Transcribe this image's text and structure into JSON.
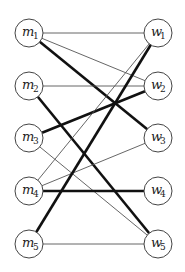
{
  "diagram": {
    "type": "bipartite-graph",
    "left_nodes": [
      {
        "id": "m1",
        "base": "m",
        "sub": "1",
        "x": 29,
        "y": 33
      },
      {
        "id": "m2",
        "base": "m",
        "sub": "2",
        "x": 29,
        "y": 86
      },
      {
        "id": "m3",
        "base": "m",
        "sub": "3",
        "x": 29,
        "y": 138
      },
      {
        "id": "m4",
        "base": "m",
        "sub": "4",
        "x": 29,
        "y": 191
      },
      {
        "id": "m5",
        "base": "m",
        "sub": "5",
        "x": 29,
        "y": 244
      }
    ],
    "right_nodes": [
      {
        "id": "w1",
        "base": "w",
        "sub": "1",
        "x": 158,
        "y": 33
      },
      {
        "id": "w2",
        "base": "w",
        "sub": "2",
        "x": 158,
        "y": 86
      },
      {
        "id": "w3",
        "base": "w",
        "sub": "3",
        "x": 158,
        "y": 138
      },
      {
        "id": "w4",
        "base": "w",
        "sub": "4",
        "x": 158,
        "y": 191
      },
      {
        "id": "w5",
        "base": "w",
        "sub": "5",
        "x": 158,
        "y": 244
      }
    ],
    "node_radius": 14,
    "edges": [
      {
        "from": "m1",
        "to": "w1",
        "weight": "thin"
      },
      {
        "from": "m1",
        "to": "w2",
        "weight": "thin"
      },
      {
        "from": "m1",
        "to": "w3",
        "weight": "thick"
      },
      {
        "from": "m2",
        "to": "w2",
        "weight": "thin"
      },
      {
        "from": "m2",
        "to": "w5",
        "weight": "thick"
      },
      {
        "from": "m3",
        "to": "w2",
        "weight": "thick"
      },
      {
        "from": "m3",
        "to": "w5",
        "weight": "thin"
      },
      {
        "from": "m4",
        "to": "w1",
        "weight": "thin"
      },
      {
        "from": "m4",
        "to": "w3",
        "weight": "thin"
      },
      {
        "from": "m4",
        "to": "w4",
        "weight": "thick"
      },
      {
        "from": "m5",
        "to": "w1",
        "weight": "thick"
      },
      {
        "from": "m5",
        "to": "w5",
        "weight": "thin"
      }
    ],
    "matching": [
      [
        "m1",
        "w3"
      ],
      [
        "m2",
        "w5"
      ],
      [
        "m3",
        "w2"
      ],
      [
        "m4",
        "w4"
      ],
      [
        "m5",
        "w1"
      ]
    ]
  }
}
